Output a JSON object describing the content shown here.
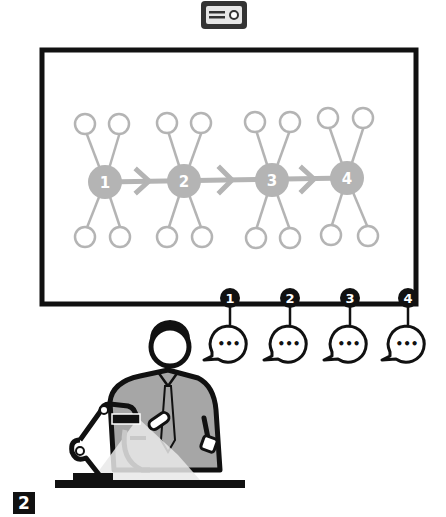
{
  "figure": {
    "panel_label": "2",
    "colors": {
      "ink": "#111111",
      "network_gray": "#b4b4b4",
      "shirt_gray": "#a6a6a6",
      "projector_body": "#333333",
      "projector_face": "#e6e6e6",
      "background": "#ffffff"
    }
  },
  "screen": {
    "x": 42,
    "y": 50,
    "width": 374,
    "height": 254,
    "hubs": [
      {
        "label": "1",
        "x": 105,
        "y": 182
      },
      {
        "label": "2",
        "x": 184,
        "y": 181
      },
      {
        "label": "3",
        "x": 272,
        "y": 180
      },
      {
        "label": "4",
        "x": 347,
        "y": 178
      }
    ]
  },
  "speech_bubbles": [
    {
      "badge": "1",
      "x": 230,
      "dots": "•••"
    },
    {
      "badge": "2",
      "x": 290,
      "dots": "•••"
    },
    {
      "badge": "3",
      "x": 350,
      "dots": "•••"
    },
    {
      "badge": "4",
      "x": 408,
      "dots": "•••"
    }
  ]
}
